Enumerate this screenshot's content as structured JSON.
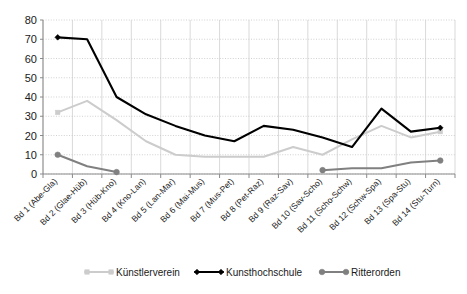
{
  "chart_data": {
    "type": "line",
    "title": "",
    "subtitle": "",
    "xlabel": "",
    "ylabel": "",
    "ylim": [
      0,
      80
    ],
    "ytick_step": 10,
    "yticks": [
      "0",
      "10",
      "20",
      "30",
      "40",
      "50",
      "60",
      "70",
      "80"
    ],
    "grid": true,
    "legend_position": "bottom",
    "categories": [
      "Bd 1 (Abe-Gla)",
      "Bd 2 (Glae-Hüb)",
      "Bd 3 (Hüb-Kno)",
      "Bd 4 (Kno-Lan)",
      "Bd 5 (Lan-Mar)",
      "Bd 6 (Mai-Mus)",
      "Bd 7 (Mus-Pet)",
      "Bd 8 (Pet-Raz)",
      "Bd 9 (Raz-Sav)",
      "Bd 10 (Sav-Scho)",
      "Bd 11 (Scho-Schw)",
      "Bd 12 (Schw-Spa)",
      "Bd 13 (Spa-Stu)",
      "Bd 14 (Stu-Turn)"
    ],
    "series": [
      {
        "name": "Künstlerverein",
        "color": "#cccccc",
        "marker": "square",
        "values": [
          32,
          38,
          28,
          17,
          10,
          9,
          9,
          9,
          14,
          10,
          18,
          25,
          19,
          22
        ]
      },
      {
        "name": "Kunsthochschule",
        "color": "#000000",
        "marker": "diamond",
        "values": [
          71,
          70,
          40,
          31,
          25,
          20,
          17,
          25,
          23,
          19,
          14,
          34,
          22,
          24
        ]
      },
      {
        "name": "Ritterorden",
        "color": "#808080",
        "marker": "circle",
        "values": [
          10,
          4,
          1,
          null,
          null,
          null,
          null,
          null,
          null,
          2,
          3,
          3,
          6,
          7
        ]
      }
    ]
  },
  "legend": {
    "items": [
      {
        "label": "Künstlerverein",
        "color": "#cccccc"
      },
      {
        "label": "Kunsthochschule",
        "color": "#000000"
      },
      {
        "label": "Ritterorden",
        "color": "#808080"
      }
    ]
  }
}
